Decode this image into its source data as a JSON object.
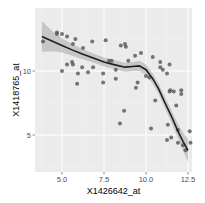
{
  "chart_data": {
    "type": "scatter",
    "title": "",
    "xlabel": "X1426642_at",
    "ylabel": "X1418765_at",
    "xlim": [
      3.6,
      12.8
    ],
    "ylim": [
      2.3,
      14.2
    ],
    "x_ticks": [
      5.0,
      7.5,
      10.0,
      12.5
    ],
    "x_tick_labels": [
      "5.0",
      "7.5",
      "10.0",
      "12.5"
    ],
    "y_ticks": [
      5,
      10
    ],
    "y_tick_labels": [
      "5",
      "10"
    ],
    "grid": true,
    "legend": "none",
    "points": [
      [
        3.87,
        12.3
      ],
      [
        4.7,
        13.0
      ],
      [
        4.7,
        12.9
      ],
      [
        5.0,
        12.9
      ],
      [
        5.3,
        12.7
      ],
      [
        5.8,
        12.5
      ],
      [
        5.65,
        12.1
      ],
      [
        6.25,
        11.8
      ],
      [
        6.8,
        12.3
      ],
      [
        7.6,
        12.4
      ],
      [
        8.5,
        12.0
      ],
      [
        8.75,
        12.1
      ],
      [
        8.8,
        11.9
      ],
      [
        9.7,
        11.4
      ],
      [
        9.35,
        11.2
      ],
      [
        10.4,
        11.1
      ],
      [
        5.0,
        10.0
      ],
      [
        5.3,
        10.5
      ],
      [
        5.6,
        10.7
      ],
      [
        5.65,
        10.5
      ],
      [
        5.95,
        9.8
      ],
      [
        6.2,
        10.3
      ],
      [
        5.9,
        9.0
      ],
      [
        6.55,
        9.9
      ],
      [
        6.85,
        10.3
      ],
      [
        7.45,
        9.1
      ],
      [
        7.45,
        9.8
      ],
      [
        7.8,
        10.8
      ],
      [
        7.95,
        10.8
      ],
      [
        8.2,
        10.1
      ],
      [
        8.2,
        9.4
      ],
      [
        8.45,
        5.9
      ],
      [
        8.7,
        6.9
      ],
      [
        8.95,
        10.8
      ],
      [
        9.4,
        8.7
      ],
      [
        9.5,
        9.1
      ],
      [
        10.0,
        9.6
      ],
      [
        10.2,
        9.5
      ],
      [
        10.3,
        5.5
      ],
      [
        10.55,
        7.7
      ],
      [
        10.85,
        10.7
      ],
      [
        10.85,
        10.3
      ],
      [
        11.0,
        10.1
      ],
      [
        11.25,
        9.8
      ],
      [
        11.4,
        10.5
      ],
      [
        11.45,
        8.5
      ],
      [
        11.4,
        8.4
      ],
      [
        11.3,
        5.8
      ],
      [
        11.25,
        4.6
      ],
      [
        11.5,
        4.8
      ],
      [
        11.65,
        8.4
      ],
      [
        11.8,
        7.3
      ],
      [
        11.9,
        5.4
      ],
      [
        11.9,
        4.4
      ],
      [
        12.1,
        8.5
      ],
      [
        12.1,
        8.2
      ],
      [
        12.2,
        4.2
      ],
      [
        12.35,
        3.8
      ],
      [
        12.6,
        5.3
      ],
      [
        12.65,
        4.4
      ]
    ],
    "smooth": {
      "method": "loess",
      "x": [
        3.8,
        4.4,
        5.0,
        5.6,
        6.25,
        6.9,
        7.5,
        8.1,
        8.75,
        9.2,
        9.6,
        10.0,
        10.4,
        10.75,
        11.1,
        11.5,
        11.9,
        12.2,
        12.5
      ],
      "y": [
        12.7,
        12.35,
        12.0,
        11.65,
        11.3,
        11.0,
        10.7,
        10.5,
        10.3,
        10.35,
        10.4,
        10.1,
        9.4,
        8.6,
        7.6,
        6.5,
        5.3,
        4.5,
        3.8
      ],
      "se_halfwidth": [
        1.2,
        0.8,
        0.55,
        0.45,
        0.4,
        0.35,
        0.35,
        0.35,
        0.35,
        0.35,
        0.4,
        0.4,
        0.4,
        0.4,
        0.45,
        0.5,
        0.55,
        0.7,
        0.9
      ]
    }
  },
  "colors": {
    "panel": "#ebebeb",
    "grid_major": "#ffffff",
    "grid_minor": "#f3f3f3",
    "point": "#555555",
    "line": "#1f1f1f",
    "ribbon": "#999999"
  }
}
